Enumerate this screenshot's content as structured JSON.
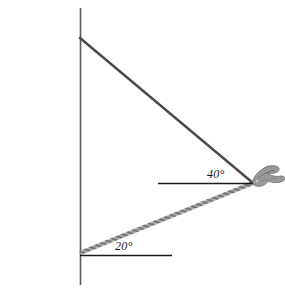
{
  "diagram": {
    "type": "geometry-diagram",
    "background_color": "#ffffff",
    "wall": {
      "name": "brick-wall",
      "description": "Vertical brick wall / cliff face with ragged faded left edge",
      "brick_color_dark": "#6b6b6b",
      "brick_color_mid": "#8c8c8c",
      "brick_color_light": "#b5b5b5",
      "mortar_color": "#e8e8e8",
      "right_edge_x": 80,
      "top_y": 8,
      "bottom_y": 285,
      "brick_row_height": 9,
      "brick_width": 17
    },
    "observer": {
      "name": "observer-object",
      "description": "Small grey object (observer / bird) at the right vertex",
      "x": 258,
      "y": 172,
      "color": "#9a9a9a"
    },
    "vertex": {
      "x": 253,
      "y": 183
    },
    "sightlines": [
      {
        "name": "upper-sightline",
        "from_label": "wall-top",
        "from_x": 80,
        "from_y": 38,
        "to_x": 253,
        "to_y": 183,
        "style": "solid",
        "color": "#4a4a4a",
        "width": 2.4
      },
      {
        "name": "lower-sightline",
        "from_label": "wall-base",
        "from_x": 80,
        "from_y": 253,
        "to_x": 253,
        "to_y": 183,
        "style": "hatched-rope",
        "color": "#8a8a8a",
        "width": 3.2
      }
    ],
    "reference_lines": [
      {
        "name": "horizontal-reference-upper",
        "x1": 158,
        "y1": 183,
        "x2": 253,
        "y2": 183,
        "color": "#1a1a1a",
        "width": 1.3
      },
      {
        "name": "horizontal-reference-lower",
        "x1": 80,
        "y1": 255,
        "x2": 172,
        "y2": 255,
        "color": "#1a1a1a",
        "width": 1.3
      }
    ],
    "labels": {
      "angle_upper": "40°",
      "angle_lower": "20°"
    }
  }
}
